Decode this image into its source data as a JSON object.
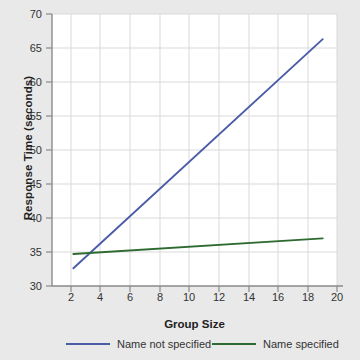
{
  "chart_data": {
    "type": "line",
    "title": "",
    "xlabel": "Group Size",
    "ylabel": "Response Time (seconds)",
    "xlim": [
      0,
      20
    ],
    "ylim": [
      30,
      70
    ],
    "xticks": [
      2,
      4,
      6,
      8,
      10,
      12,
      14,
      16,
      18,
      20
    ],
    "yticks": [
      30,
      35,
      40,
      45,
      50,
      55,
      60,
      65,
      70
    ],
    "grid": true,
    "legend_position": "bottom",
    "series": [
      {
        "name": "Name not specified",
        "color": "#4a5ba8",
        "x": [
          1.5,
          19.0
        ],
        "values": [
          32.6,
          66.3
        ]
      },
      {
        "name": "Name specified",
        "color": "#2e6b31",
        "x": [
          1.5,
          19.0
        ],
        "values": [
          34.7,
          37.0
        ]
      }
    ]
  },
  "axes": {
    "y_title": "Response Time (seconds)",
    "x_title": "Group Size",
    "y_tick_labels": [
      "70",
      "65",
      "60",
      "55",
      "50",
      "45",
      "40",
      "35",
      "30"
    ],
    "x_tick_labels": [
      "2",
      "4",
      "6",
      "8",
      "10",
      "12",
      "14",
      "16",
      "18",
      "20"
    ]
  },
  "legend": {
    "items": [
      {
        "label": "Name not specified",
        "color": "#4a5ba8"
      },
      {
        "label": "Name specified",
        "color": "#2e6b31"
      }
    ]
  },
  "colors": {
    "page_background": "#e9e9e9",
    "plot_background": "#ffffff",
    "grid": "#d9d9d9",
    "axis": "#808080",
    "text": "#333333",
    "series_blue": "#4a5ba8",
    "series_green": "#2e6b31"
  }
}
